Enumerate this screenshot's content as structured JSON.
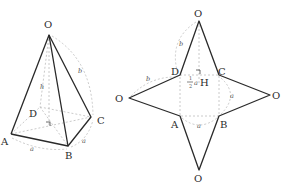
{
  "pyramid": {
    "vertices": {
      "O": {
        "label": "O"
      },
      "A": {
        "label": "A"
      },
      "B": {
        "label": "B"
      },
      "C": {
        "label": "C"
      },
      "D": {
        "label": "D"
      }
    },
    "edge_labels": {
      "height": "h",
      "lateral": "b",
      "base_front": "a",
      "base_side": "a"
    }
  },
  "net": {
    "center_vertices": {
      "A": "A",
      "B": "B",
      "C": "C",
      "D": "D"
    },
    "apex_labels": {
      "top": "O",
      "left": "O",
      "right": "O",
      "bottom": "O"
    },
    "center_label": "H",
    "half_a_num": "1",
    "half_a_den": "2",
    "half_a_var": "a",
    "edge_labels": {
      "top_arc": "b",
      "left_arc": "b",
      "right_arc": "a",
      "bottom_arc": "a"
    }
  }
}
